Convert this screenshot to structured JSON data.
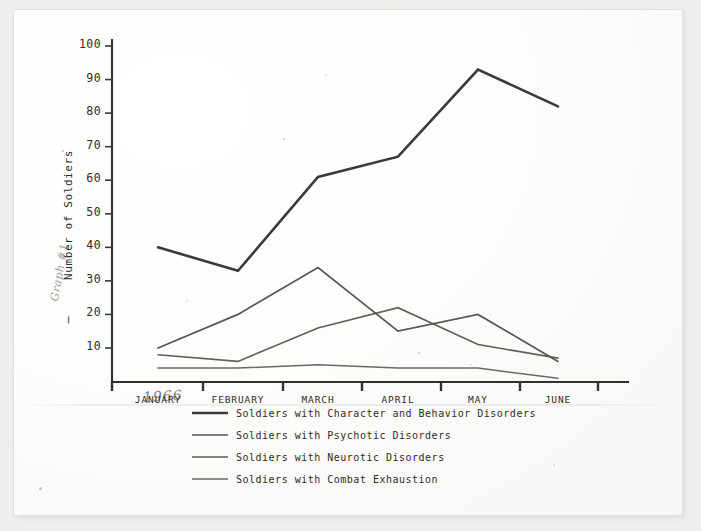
{
  "document": {
    "kind": "scanned-photograph-of-chart",
    "margin_note": "Graph #1",
    "handwritten_year": "1966"
  },
  "chart_data": {
    "type": "line",
    "title": "",
    "xlabel": "",
    "ylabel": "Number of Soldiers",
    "ylim": [
      0,
      100
    ],
    "yticks": [
      10,
      20,
      30,
      40,
      50,
      60,
      70,
      80,
      90,
      100
    ],
    "grid": false,
    "legend_position": "below-axis",
    "categories": [
      "JANUARY",
      "FEBRUARY",
      "MARCH",
      "APRIL",
      "MAY",
      "JUNE"
    ],
    "series": [
      {
        "name": "Soldiers with Character and Behavior Disorders",
        "values": [
          40,
          33,
          61,
          67,
          93,
          82
        ],
        "color": "#2b2926",
        "width": 2.6
      },
      {
        "name": "Soldiers with Psychotic Disorders",
        "values": [
          10,
          20,
          34,
          15,
          20,
          6
        ],
        "color": "#4a4743",
        "width": 1.7
      },
      {
        "name": "Soldiers with Neurotic Disorders",
        "values": [
          8,
          6,
          16,
          22,
          11,
          7
        ],
        "color": "#54514c",
        "width": 1.6
      },
      {
        "name": "Soldiers with Combat Exhaustion",
        "values": [
          4,
          4,
          5,
          4,
          4,
          1
        ],
        "color": "#605c57",
        "width": 1.5
      }
    ]
  },
  "axis": {
    "y_axis_title": "Number of Soldiers",
    "y_tick_labels": [
      "100",
      "90",
      "80",
      "70",
      "60",
      "50",
      "40",
      "30",
      "20",
      "10"
    ],
    "x_tick_labels": [
      "JANUARY",
      "FEBRUARY",
      "MARCH",
      "APRIL",
      "MAY",
      "JUNE"
    ]
  },
  "legend": {
    "items": [
      {
        "label": "Soldiers with Character and Behavior Disorders",
        "color": "#2b2926",
        "width": 2.6
      },
      {
        "label": "Soldiers with Psychotic Disorders",
        "color": "#4a4743",
        "width": 1.7
      },
      {
        "label": "Soldiers with Neurotic Disorders",
        "color": "#54514c",
        "width": 1.6
      },
      {
        "label": "Soldiers with Combat Exhaustion",
        "color": "#605c57",
        "width": 1.5
      }
    ]
  }
}
